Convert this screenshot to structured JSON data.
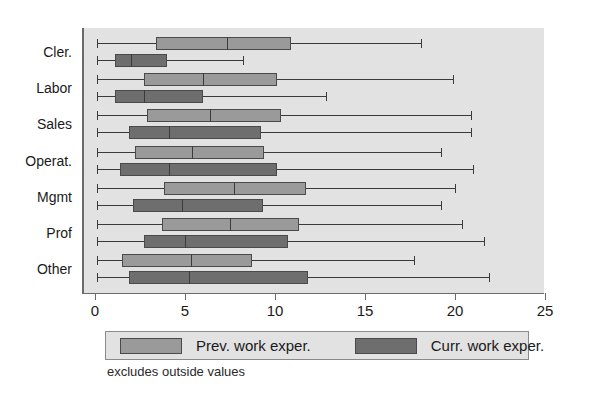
{
  "chart_data": {
    "type": "boxplot",
    "title": "",
    "xlabel": "",
    "ylabel": "",
    "orientation": "horizontal",
    "xlim": [
      0,
      25
    ],
    "xticks": [
      0,
      5,
      10,
      15,
      20,
      25
    ],
    "xtick_labels": [
      "0",
      "5",
      "10",
      "15",
      "20",
      "25"
    ],
    "grid": false,
    "categories": [
      "Cler.",
      "Labor",
      "Sales",
      "Operat.",
      "Mgmt",
      "Prof",
      "Other"
    ],
    "legend_position": "bottom",
    "note": "excludes outside values",
    "legend": [
      {
        "name": "Prev. work exper.",
        "color": "#9a9a9a"
      },
      {
        "name": "Curr. work exper.",
        "color": "#6e6e6e"
      }
    ],
    "series": [
      {
        "name": "Prev. work exper.",
        "key": "prev",
        "color": "#9a9a9a",
        "boxes": [
          {
            "category": "Cler.",
            "whisker_low": 0.0,
            "q1": 3.3,
            "median": 7.2,
            "q3": 10.8,
            "whisker_high": 18.0
          },
          {
            "category": "Labor",
            "whisker_low": 0.0,
            "q1": 2.6,
            "median": 5.9,
            "q3": 10.0,
            "whisker_high": 19.8
          },
          {
            "category": "Sales",
            "whisker_low": 0.0,
            "q1": 2.8,
            "median": 6.3,
            "q3": 10.2,
            "whisker_high": 20.8
          },
          {
            "category": "Operat.",
            "whisker_low": 0.0,
            "q1": 2.1,
            "median": 5.3,
            "q3": 9.3,
            "whisker_high": 19.1
          },
          {
            "category": "Mgmt",
            "whisker_low": 0.0,
            "q1": 3.7,
            "median": 7.6,
            "q3": 11.6,
            "whisker_high": 19.9
          },
          {
            "category": "Prof",
            "whisker_low": 0.0,
            "q1": 3.6,
            "median": 7.4,
            "q3": 11.2,
            "whisker_high": 20.3
          },
          {
            "category": "Other",
            "whisker_low": 0.0,
            "q1": 1.4,
            "median": 5.2,
            "q3": 8.6,
            "whisker_high": 17.6
          }
        ]
      },
      {
        "name": "Curr. work exper.",
        "key": "curr",
        "color": "#6e6e6e",
        "boxes": [
          {
            "category": "Cler.",
            "whisker_low": 0.0,
            "q1": 1.0,
            "median": 1.9,
            "q3": 3.9,
            "whisker_high": 8.1
          },
          {
            "category": "Labor",
            "whisker_low": 0.0,
            "q1": 1.0,
            "median": 2.6,
            "q3": 5.9,
            "whisker_high": 12.7
          },
          {
            "category": "Sales",
            "whisker_low": 0.0,
            "q1": 1.8,
            "median": 4.0,
            "q3": 9.1,
            "whisker_high": 20.8
          },
          {
            "category": "Operat.",
            "whisker_low": 0.0,
            "q1": 1.3,
            "median": 4.0,
            "q3": 10.0,
            "whisker_high": 20.9
          },
          {
            "category": "Mgmt",
            "whisker_low": 0.0,
            "q1": 2.0,
            "median": 4.7,
            "q3": 9.2,
            "whisker_high": 19.1
          },
          {
            "category": "Prof",
            "whisker_low": 0.0,
            "q1": 2.6,
            "median": 4.9,
            "q3": 10.6,
            "whisker_high": 21.5
          },
          {
            "category": "Other",
            "whisker_low": 0.0,
            "q1": 1.8,
            "median": 5.1,
            "q3": 11.7,
            "whisker_high": 21.8
          }
        ]
      }
    ]
  }
}
